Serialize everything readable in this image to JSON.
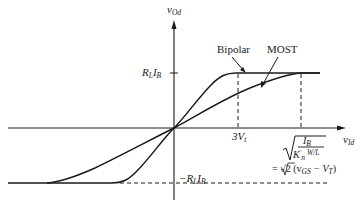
{
  "axes": {
    "y_label": "v",
    "y_label_sub": "Od",
    "x_label": "v",
    "x_label_sub": "Id"
  },
  "levels": {
    "top": {
      "main": "R",
      "sub1": "L",
      "main2": "I",
      "sub2": "B"
    },
    "bottom": {
      "prefix": "−R",
      "sub1": "L",
      "main2": "I",
      "sub2": "B"
    }
  },
  "curves": {
    "bipolar_label": "Bipolar",
    "most_label": "MOST"
  },
  "x_marks": {
    "bipolar_sat": {
      "coef": "3V",
      "sub": "t"
    },
    "most_sat": {
      "numerator": "I",
      "numerator_sub": "B",
      "denominator": "K",
      "denominator_sup": "′",
      "denominator_sub": "n",
      "ratio": "W/L",
      "equals": "= √2 (v",
      "eq_sub1": "GS",
      "eq_mid": " − V",
      "eq_sub2": "T",
      "eq_end": ")"
    }
  },
  "colors": {
    "ink": "#1a1a1a",
    "background": "#ffffff"
  }
}
